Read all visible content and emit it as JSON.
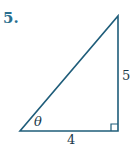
{
  "problem": {
    "number": "5.",
    "figure": "right-triangle",
    "side_vertical_label": "5",
    "side_horizontal_label": "4",
    "angle_label": "θ",
    "line_color": "#1f5d7a",
    "number_color": "#2a6f8f"
  }
}
